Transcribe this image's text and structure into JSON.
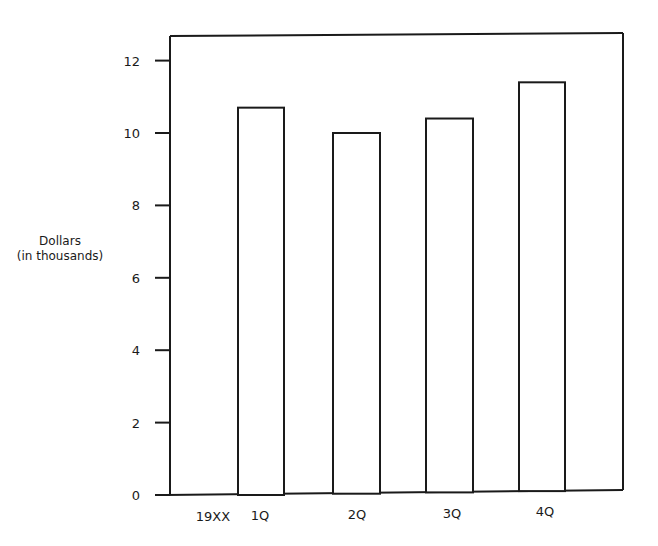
{
  "chart_data": {
    "type": "bar",
    "title": "",
    "xlabel": "",
    "ylabel": "Dollars (in thousands)",
    "ylabel_lines": [
      "Dollars",
      "(in thousands)"
    ],
    "year_label": "19XX",
    "categories": [
      "1Q",
      "2Q",
      "3Q",
      "4Q"
    ],
    "values": [
      10.7,
      10.0,
      10.4,
      11.4
    ],
    "yticks": [
      0,
      2,
      4,
      6,
      8,
      10,
      12
    ],
    "ylim": [
      0,
      12.9
    ],
    "grid": false,
    "legend": null,
    "bar_fill": "#ffffff",
    "bar_stroke": "#1a1a1a"
  }
}
